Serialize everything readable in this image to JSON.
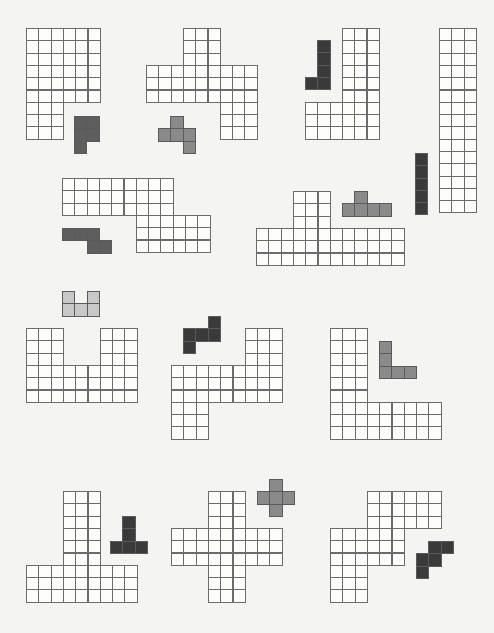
{
  "cell_size": 12.3,
  "colors": {
    "board_cell": "#fdfdfc",
    "board_line": "#6b6b6b",
    "dark": "#3a3a3a",
    "mid_dark": "#5e5e5e",
    "gray": "#8a8a8a",
    "light": "#c8c8c8"
  },
  "puzzles": [
    {
      "id": "puzzle-1",
      "board": {
        "x": 26,
        "y": 28,
        "rows": [
          "111111",
          "111111",
          "111111",
          "111111",
          "111111",
          "111111",
          "111000",
          "111000",
          "111000"
        ]
      },
      "piece": {
        "x": 74,
        "y": 116,
        "color": "mid_dark",
        "rows": [
          "11",
          "11",
          "10"
        ]
      }
    },
    {
      "id": "puzzle-2",
      "board": {
        "x": 146,
        "y": 28,
        "rows": [
          "000111000",
          "000111000",
          "000111000",
          "111111111",
          "111111111",
          "111111111",
          "000000111",
          "000000111",
          "000000111"
        ]
      },
      "piece": {
        "x": 158,
        "y": 116,
        "color": "gray",
        "rows": [
          "010",
          "111",
          "001"
        ]
      }
    },
    {
      "id": "puzzle-3",
      "board": {
        "x": 305,
        "y": 28,
        "rows": [
          "000111",
          "000111",
          "000111",
          "000111",
          "000111",
          "000111",
          "111111",
          "111111",
          "111111"
        ]
      },
      "piece": {
        "x": 305,
        "y": 40,
        "color": "dark",
        "rows": [
          "01",
          "01",
          "01",
          "11"
        ]
      }
    },
    {
      "id": "puzzle-4",
      "board": {
        "x": 439,
        "y": 28,
        "rows": [
          "111",
          "111",
          "111",
          "111",
          "111",
          "111",
          "111",
          "111",
          "111",
          "111",
          "111",
          "111",
          "111",
          "111",
          "111"
        ]
      },
      "piece": {
        "x": 415,
        "y": 153,
        "color": "dark",
        "rows": [
          "1",
          "1",
          "1",
          "1",
          "1"
        ]
      }
    },
    {
      "id": "puzzle-5",
      "board": {
        "x": 62,
        "y": 178,
        "rows": [
          "111111111000",
          "111111111000",
          "111111111000",
          "000000111111",
          "000000111111",
          "000000111111"
        ]
      },
      "piece": {
        "x": 62,
        "y": 228,
        "color": "mid_dark",
        "rows": [
          "1110",
          "0011"
        ]
      }
    },
    {
      "id": "puzzle-6",
      "board": {
        "x": 256,
        "y": 191,
        "rows": [
          "000111000000",
          "000111000000",
          "000111000000",
          "111111111111",
          "111111111111",
          "111111111111"
        ]
      },
      "piece": {
        "x": 342,
        "y": 191,
        "color": "gray",
        "rows": [
          "0100",
          "1111"
        ]
      }
    },
    {
      "id": "puzzle-7",
      "board": {
        "x": 26,
        "y": 328,
        "rows": [
          "111000111",
          "111000111",
          "111000111",
          "111111111",
          "111111111",
          "111111111"
        ]
      },
      "piece": {
        "x": 62,
        "y": 291,
        "color": "light",
        "rows": [
          "101",
          "111"
        ]
      }
    },
    {
      "id": "puzzle-8",
      "board": {
        "x": 171,
        "y": 328,
        "rows": [
          "000000111",
          "000000111",
          "000000111",
          "111111111",
          "111111111",
          "111111111",
          "111000000",
          "111000000",
          "111000000"
        ]
      },
      "piece": {
        "x": 183,
        "y": 316,
        "color": "dark",
        "rows": [
          "001",
          "111",
          "100"
        ]
      }
    },
    {
      "id": "puzzle-9",
      "board": {
        "x": 330,
        "y": 328,
        "rows": [
          "111000000",
          "111000000",
          "111000000",
          "111000000",
          "111000000",
          "111000000",
          "111111111",
          "111111111",
          "111111111"
        ]
      },
      "piece": {
        "x": 379,
        "y": 341,
        "color": "gray",
        "rows": [
          "100",
          "100",
          "111"
        ]
      }
    },
    {
      "id": "puzzle-10",
      "board": {
        "x": 26,
        "y": 491,
        "rows": [
          "000111000",
          "000111000",
          "000111000",
          "000111000",
          "000111000",
          "000111000",
          "111111111",
          "111111111",
          "111111111"
        ]
      },
      "piece": {
        "x": 110,
        "y": 516,
        "color": "dark",
        "rows": [
          "010",
          "010",
          "111"
        ]
      }
    },
    {
      "id": "puzzle-11",
      "board": {
        "x": 171,
        "y": 491,
        "rows": [
          "000111000",
          "000111000",
          "000111000",
          "111111111",
          "111111111",
          "111111111",
          "000111000",
          "000111000",
          "000111000"
        ]
      },
      "piece": {
        "x": 257,
        "y": 479,
        "color": "gray",
        "rows": [
          "010",
          "111",
          "010"
        ]
      }
    },
    {
      "id": "puzzle-12",
      "board": {
        "x": 330,
        "y": 491,
        "rows": [
          "000111111",
          "000111111",
          "000111111",
          "111111000",
          "111111000",
          "111111000",
          "111000000",
          "111000000",
          "111000000"
        ]
      },
      "piece": {
        "x": 416,
        "y": 541,
        "color": "dark",
        "rows": [
          "011",
          "110",
          "100"
        ]
      }
    }
  ]
}
